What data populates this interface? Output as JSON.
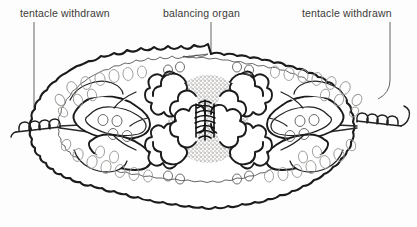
{
  "figure": {
    "background_color": "#fdfdfd",
    "ink_color": "#1b1b1b",
    "label_color": "#3c3a38",
    "shading_color": "#8e8c88"
  },
  "labels": {
    "left": {
      "text": "tentacle withdrawn",
      "x": 20,
      "y": 17,
      "leader_x": 34,
      "leader_top": 22,
      "leader_bottom": 128
    },
    "center": {
      "text": "balancing organ",
      "x": 163,
      "y": 17,
      "leader_x": 211,
      "leader_top": 22,
      "leader_bottom": 120
    },
    "right": {
      "text": "tentacle withdrawn",
      "x": 302,
      "y": 17,
      "leader_x": 390,
      "leader_top": 22,
      "leader_bottom": 90
    }
  },
  "anatomy": {
    "body_bounds": {
      "x1": 45,
      "y1": 44,
      "x2": 376,
      "y2": 201
    },
    "statocyst": {
      "x": 205,
      "y": 119,
      "label": "balancing organ"
    },
    "shaded_disc": {
      "cx": 208,
      "cy": 119,
      "rx": 38,
      "ry": 42
    },
    "left_tentacle": {
      "x1": 16,
      "y1": 130,
      "x2": 60,
      "y2": 126
    },
    "right_tentacle": {
      "x1": 358,
      "y1": 122,
      "x2": 402,
      "y2": 112
    }
  }
}
